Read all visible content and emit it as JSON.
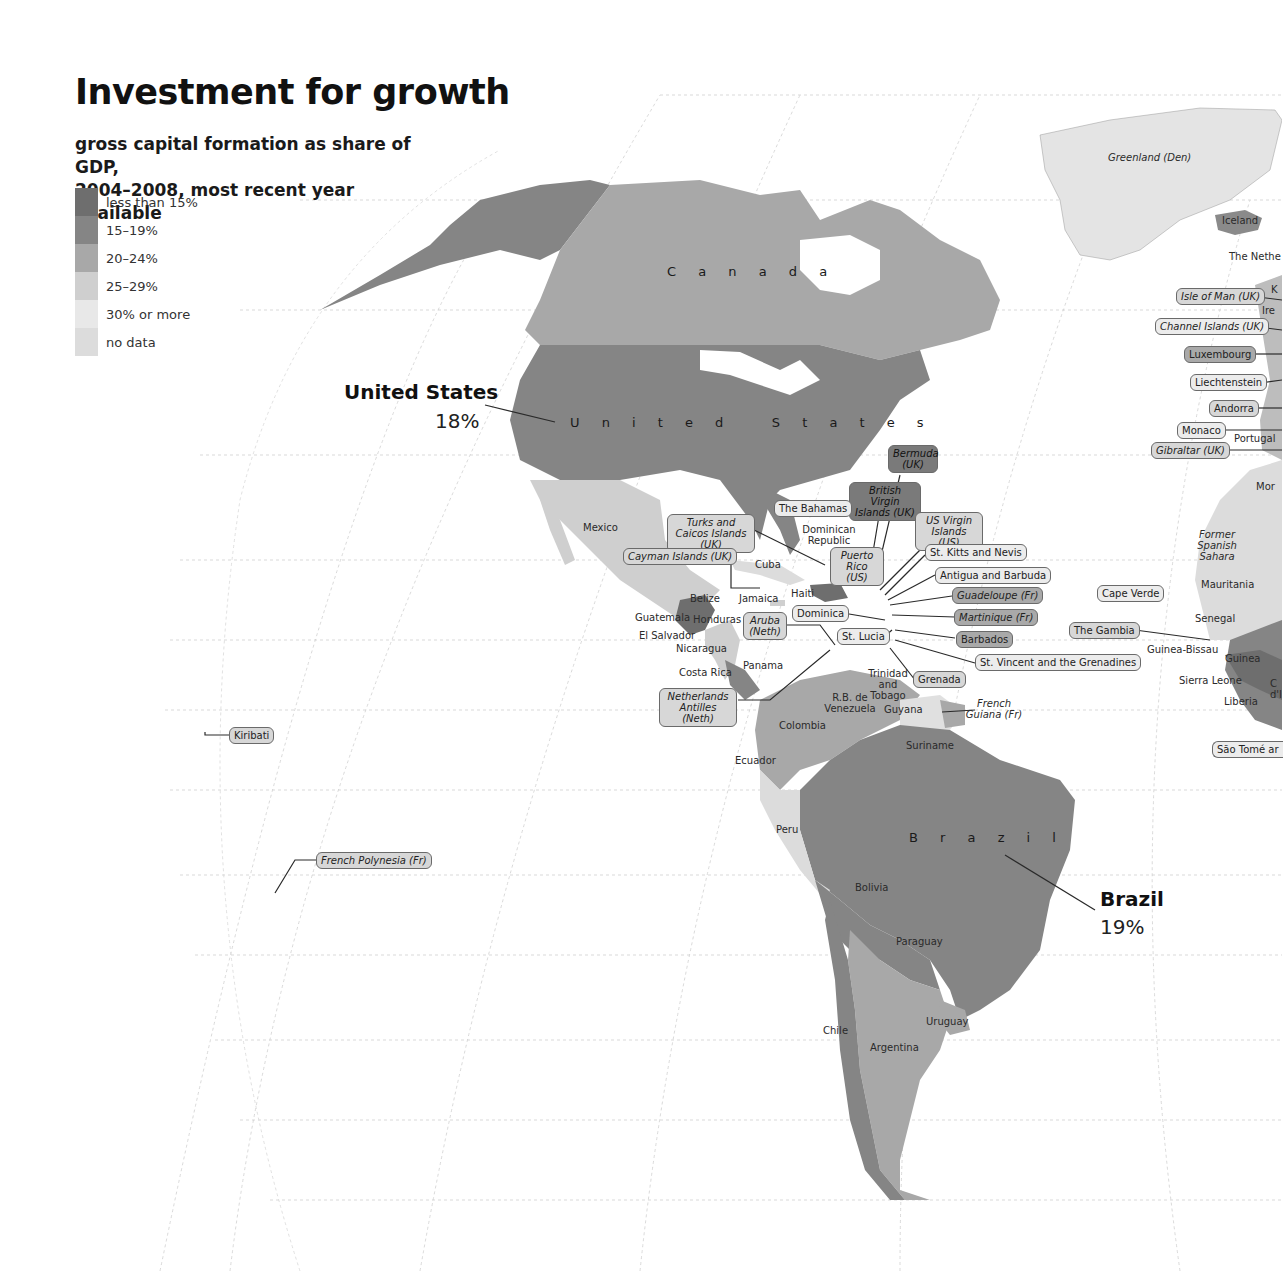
{
  "header": {
    "title": "Investment for growth",
    "subtitle_line1": "gross capital formation as share of GDP,",
    "subtitle_line2": "2004–2008, most recent year available"
  },
  "legend": {
    "items": [
      {
        "label": "less than 15%",
        "color": "#6e6e6e"
      },
      {
        "label": "15–19%",
        "color": "#858585"
      },
      {
        "label": "20–24%",
        "color": "#a8a8a8"
      },
      {
        "label": "25–29%",
        "color": "#cfcfcf"
      },
      {
        "label": "30% or more",
        "color": "#e8e8e8"
      },
      {
        "label": "no data",
        "color": "#dcdcdc"
      }
    ]
  },
  "callouts": {
    "us": {
      "name": "United States",
      "value": "18%"
    },
    "brazil": {
      "name": "Brazil",
      "value": "19%"
    }
  },
  "regions": {
    "canada": "C a n a d a",
    "us": "U n i t e d   S t a t e s",
    "brazil": "B r a z i l",
    "greenland": "Greenland (Den)",
    "iceland": "Iceland",
    "netherlands": "The Nethe",
    "k": "K",
    "ireland": "Ire",
    "portugal": "Portugal",
    "morocco": "Mor",
    "former_spanish_sahara": "Former Spanish Sahara",
    "mauritania": "Mauritania",
    "senegal": "Senegal",
    "guinea_bissau": "Guinea-Bissau",
    "guinea": "Guinea",
    "sierra_leone": "Sierra Leone",
    "liberia": "Liberia",
    "cote": "C d'I",
    "mexico": "Mexico",
    "cuba": "Cuba",
    "dominican_republic": "Dominican Republic",
    "haiti": "Haiti",
    "jamaica": "Jamaica",
    "belize": "Belize",
    "guatemala": "Guatemala",
    "honduras": "Honduras",
    "el_salvador": "El Salvador",
    "nicaragua": "Nicaragua",
    "costa_rica": "Costa Rica",
    "panama": "Panama",
    "trinidad": "Trinidad and Tobago",
    "venezuela": "R.B. de Venezuela",
    "guyana": "Guyana",
    "suriname": "Suriname",
    "french_guiana": "French Guiana (Fr)",
    "colombia": "Colombia",
    "ecuador": "Ecuador",
    "peru": "Peru",
    "bolivia": "Bolivia",
    "paraguay": "Paraguay",
    "uruguay": "Uruguay",
    "chile": "Chile",
    "argentina": "Argentina"
  },
  "boxed_labels": {
    "bermuda": "Bermuda (UK)",
    "bvi": "British Virgin Islands (UK)",
    "bahamas": "The Bahamas",
    "usvi": "US Virgin Islands (US)",
    "turks": "Turks and Caicos Islands (UK)",
    "cayman": "Cayman Islands (UK)",
    "puerto_rico": "Puerto Rico (US)",
    "st_kitts": "St. Kitts and Nevis",
    "antigua": "Antigua and Barbuda",
    "guadeloupe": "Guadeloupe (Fr)",
    "martinique": "Martinique (Fr)",
    "barbados": "Barbados",
    "st_vincent": "St. Vincent and the Grenadines",
    "grenada": "Grenada",
    "st_lucia": "St. Lucia",
    "dominica": "Dominica",
    "aruba": "Aruba (Neth)",
    "neth_antilles": "Netherlands Antilles (Neth)",
    "kiribati": "Kiribati",
    "french_polynesia": "French Polynesia (Fr)",
    "cape_verde": "Cape Verde",
    "gambia": "The Gambia",
    "sao_tome": "São Tomé ar",
    "isle_of_man": "Isle of Man (UK)",
    "channel_islands": "Channel Islands (UK)",
    "luxembourg": "Luxembourg",
    "liechtenstein": "Liechtenstein",
    "andorra": "Andorra",
    "monaco": "Monaco",
    "gibraltar": "Gibraltar (UK)"
  }
}
